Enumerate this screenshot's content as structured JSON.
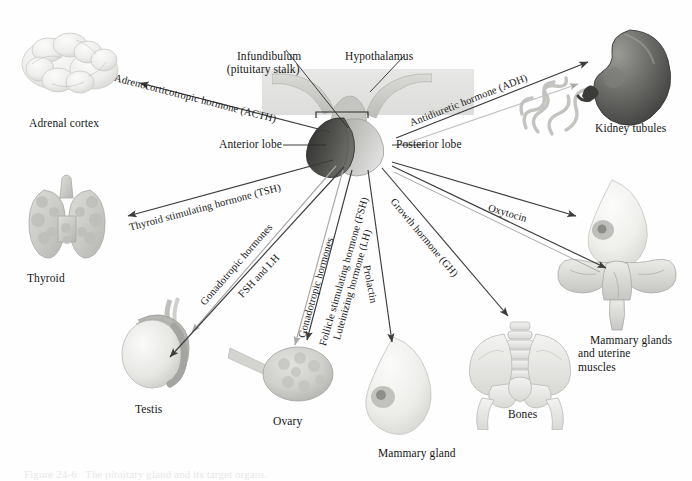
{
  "figure": {
    "caption": "Figure 24-6   The pituitary gland and its target organs."
  },
  "central_structures": [
    {
      "id": "infundibulum",
      "label": "Infundibulum\n(pituitary stalk)"
    },
    {
      "id": "hypothalamus",
      "label": "Hypothalamus"
    },
    {
      "id": "anterior-lobe",
      "label": "Anterior lobe"
    },
    {
      "id": "posterior-lobe",
      "label": "Posterior lobe"
    }
  ],
  "target_organs": [
    {
      "id": "adrenal-cortex",
      "label": "Adrenal cortex"
    },
    {
      "id": "thyroid",
      "label": "Thyroid"
    },
    {
      "id": "testis",
      "label": "Testis"
    },
    {
      "id": "ovary",
      "label": "Ovary"
    },
    {
      "id": "mammary-gland",
      "label": "Mammary gland"
    },
    {
      "id": "bones",
      "label": "Bones"
    },
    {
      "id": "mammary-uterine",
      "label": "Mammary glands\nand uterine\nmuscles"
    },
    {
      "id": "kidney-tubules",
      "label": "Kidney tubules"
    }
  ],
  "hormones": [
    {
      "id": "acth",
      "label": "Adrenocorticotropic hormone (ACTH)",
      "lobe": "anterior",
      "target": "adrenal-cortex"
    },
    {
      "id": "tsh",
      "label": "Thyroid stimulating hormone (TSH)",
      "lobe": "anterior",
      "target": "thyroid"
    },
    {
      "id": "gonado-1",
      "label": "Gonadotropic hormones",
      "lobe": "anterior",
      "target": "testis"
    },
    {
      "id": "fsh-lh",
      "label": "FSH and LH",
      "lobe": "anterior",
      "target": "testis"
    },
    {
      "id": "gonado-2",
      "label": "Gonadotropic hormones",
      "lobe": "anterior",
      "target": "ovary"
    },
    {
      "id": "fsh",
      "label": "Follicle stimulating hormone (FSH)",
      "lobe": "anterior",
      "target": "ovary"
    },
    {
      "id": "lh",
      "label": "Luteinizing hormone (LH)",
      "lobe": "anterior",
      "target": "ovary"
    },
    {
      "id": "prolactin",
      "label": "Prolactin",
      "lobe": "anterior",
      "target": "mammary-gland"
    },
    {
      "id": "gh",
      "label": "Growth hormone (GH)",
      "lobe": "anterior",
      "target": "bones"
    },
    {
      "id": "oxytocin",
      "label": "Oxytocin",
      "lobe": "posterior",
      "target": "mammary-uterine"
    },
    {
      "id": "adh",
      "label": "Antidiuretic hormone (ADH)",
      "lobe": "posterior",
      "target": "kidney-tubules"
    }
  ],
  "colors": {
    "background": "#fefefe",
    "ink": "#161616",
    "arrow_dark": "#3c3c3c",
    "arrow_light": "#a8a8a8",
    "anterior_lobe": "#4a4a4a",
    "posterior_lobe": "#b9b9b7",
    "organ_tint": "#cfcfcd"
  }
}
